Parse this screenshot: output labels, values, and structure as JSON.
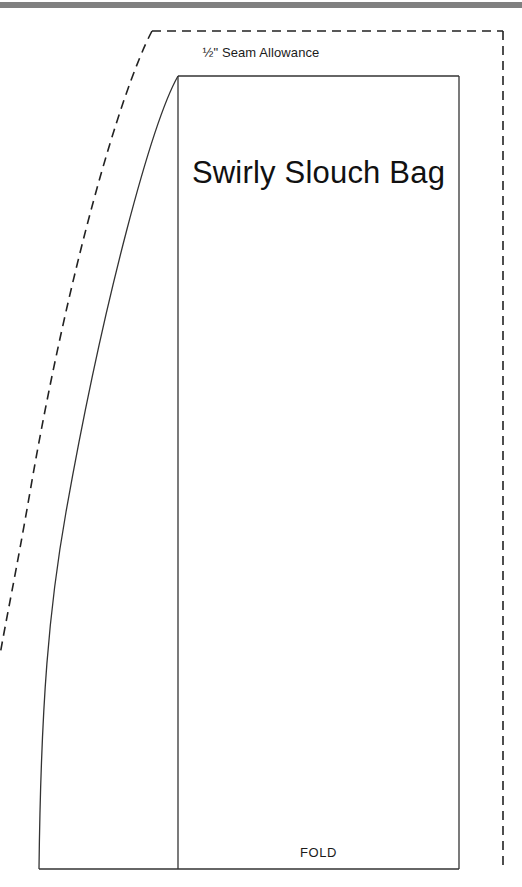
{
  "document": {
    "type": "sewing-pattern-sheet",
    "title": "Swirly Slouch Bag"
  },
  "labels": {
    "seam_allowance": "½\" Seam Allowance",
    "fold": "FOLD"
  },
  "colors": {
    "ink": "#1b1b1b",
    "cut_line": "#333333",
    "seam_line": "#222222",
    "scan_bar": "#808080",
    "paper": "#ffffff"
  },
  "pattern_geometry": {
    "cut_line_dash": "9 6",
    "stroke_width_solid": 1.3,
    "stroke_width_dashed": 1.6,
    "solid_outline": {
      "description": "Main sewing line: straight top edge, straight right edge, straight bottom edge, curved left side sweeping from top-left corner down to a near-vertical left edge.",
      "top_left": [
        178,
        76
      ],
      "top_right": [
        459,
        76
      ],
      "bottom_right": [
        459,
        869
      ],
      "bottom_left": [
        39,
        869
      ],
      "left_curve": "M178,76 C150,130 100,300 62,520 C46,620 40,700 39,869"
    },
    "dashed_outline": {
      "description": "½ inch seam allowance line offset outward from the sewing line; open at bottom and at the left edge of the sheet.",
      "corner_left": [
        152,
        31
      ],
      "corner_right": [
        503,
        31
      ],
      "right_bottom": [
        503,
        866
      ],
      "left_exit": [
        0,
        655
      ]
    },
    "fold_line": {
      "description": "Vertical fold line at the left side of the titled panel.",
      "x": 178,
      "y_top": 76,
      "y_bottom": 869
    }
  }
}
